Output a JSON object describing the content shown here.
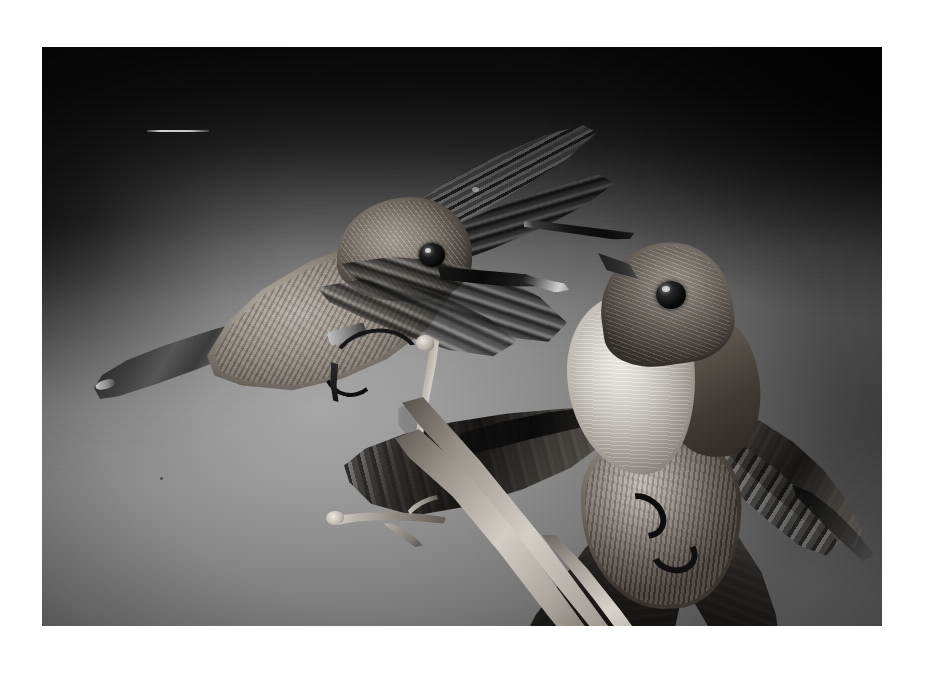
{
  "page": {
    "background_color": "#ffffff",
    "width": 932,
    "height": 673
  },
  "photograph": {
    "title": "Two hummingbirds",
    "caption": "",
    "medium": "black-and-white photograph",
    "frame": {
      "left": 42,
      "top": 47,
      "width": 840,
      "height": 579
    },
    "background": {
      "description": "smooth studio backdrop, dark in the upper corners, brightening toward the lower-left centre",
      "darkest_color": "#050505",
      "mid_color": "#8a8a8a",
      "brightest_color": "#a9a9a9"
    },
    "subjects": [
      {
        "id": "bird-flying",
        "label": "hovering hummingbird",
        "position": "upper left",
        "pose": "in flight, wings blurred mid-beat, body angled down-left, bill pointing right",
        "features": [
          "mottled pale back",
          "dark blurred wings",
          "long dark bill",
          "black eye",
          "curled dark feet",
          "long dark tail"
        ]
      },
      {
        "id": "bird-perched",
        "label": "perched hummingbird",
        "position": "lower right",
        "pose": "clinging to a twig with wings and tail fully spread, head tilted up and back, bill pointing up-left",
        "features": [
          "white throat and breast",
          "dark grey head",
          "spread dark wings",
          "fanned tail",
          "black gripping feet",
          "long straight bill"
        ]
      },
      {
        "id": "twig",
        "label": "bare forked twig",
        "position": "centre, running top to bottom-right",
        "features": [
          "pale bark",
          "side fork to the left",
          "small spur knobs",
          "tapered tips"
        ]
      }
    ],
    "marks": [
      {
        "id": "scratch",
        "label": "thin white horizontal scratch",
        "position": "upper left of frame",
        "color": "#dcdcdc"
      }
    ]
  }
}
